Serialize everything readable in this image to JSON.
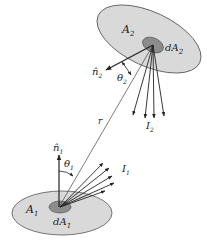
{
  "diagram": {
    "surfaces": [
      {
        "id": "surface-1",
        "area_label": "A",
        "area_sub": "1",
        "element_label": "dA",
        "element_sub": "1",
        "normal_label": "n̂",
        "normal_sub": "1",
        "angle_label": "θ",
        "angle_sub": "1",
        "intensity_label": "I",
        "intensity_sub": "1"
      },
      {
        "id": "surface-2",
        "area_label": "A",
        "area_sub": "2",
        "element_label": "dA",
        "element_sub": "2",
        "normal_label": "n̂",
        "normal_sub": "2",
        "angle_label": "θ",
        "angle_sub": "2",
        "intensity_label": "I",
        "intensity_sub": "2"
      }
    ],
    "distance_label": "r",
    "colors": {
      "outer_disk": "#d9d9d9",
      "inner_disk": "#8c8c8c",
      "stroke": "#222222"
    }
  }
}
